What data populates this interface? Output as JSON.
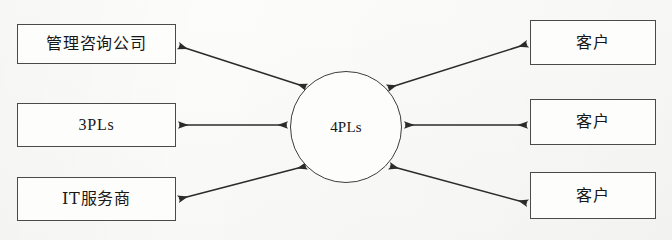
{
  "diagram": {
    "background_color": "#fbfbf9",
    "stroke_color": "#4a4a4a",
    "text_color": "#171717",
    "hub": {
      "label": "4PLs",
      "shape": "circle",
      "cx": 346,
      "cy": 127,
      "r": 56
    },
    "left_nodes": [
      {
        "label": "管理咨询公司",
        "x": 17,
        "y": 24,
        "w": 159,
        "h": 40,
        "script": "cn"
      },
      {
        "label": "3PLs",
        "x": 17,
        "y": 103,
        "w": 159,
        "h": 44,
        "script": "latin"
      },
      {
        "label": "IT服务商",
        "x": 17,
        "y": 177,
        "w": 159,
        "h": 44,
        "script": "mixed"
      }
    ],
    "right_nodes": [
      {
        "label": "客户",
        "x": 530,
        "y": 20,
        "w": 126,
        "h": 45,
        "script": "cn"
      },
      {
        "label": "客户",
        "x": 530,
        "y": 99,
        "w": 126,
        "h": 46,
        "script": "cn"
      },
      {
        "label": "客户",
        "x": 530,
        "y": 172,
        "w": 126,
        "h": 47,
        "script": "cn"
      }
    ],
    "edges": [
      {
        "name": "edge-consulting-hub",
        "from": "管理咨询公司",
        "to": "4PLs",
        "direction": "bidirectional",
        "x1": 179,
        "y1": 46,
        "x2": 306,
        "y2": 87
      },
      {
        "name": "edge-3pls-hub",
        "from": "3PLs",
        "to": "4PLs",
        "direction": "bidirectional",
        "x1": 179,
        "y1": 125,
        "x2": 287,
        "y2": 125
      },
      {
        "name": "edge-itservice-hub",
        "from": "IT服务商",
        "to": "4PLs",
        "direction": "bidirectional",
        "x1": 179,
        "y1": 199,
        "x2": 306,
        "y2": 166
      },
      {
        "name": "edge-hub-customer-top",
        "from": "4PLs",
        "to": "客户",
        "direction": "bidirectional",
        "x1": 388,
        "y1": 88,
        "x2": 527,
        "y2": 44
      },
      {
        "name": "edge-hub-customer-middle",
        "from": "4PLs",
        "to": "客户",
        "direction": "bidirectional",
        "x1": 405,
        "y1": 125,
        "x2": 527,
        "y2": 125
      },
      {
        "name": "edge-hub-customer-bottom",
        "from": "4PLs",
        "to": "客户",
        "direction": "bidirectional",
        "x1": 390,
        "y1": 166,
        "x2": 527,
        "y2": 203
      }
    ]
  }
}
